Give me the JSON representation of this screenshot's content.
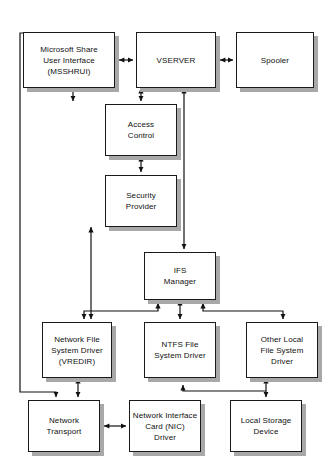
{
  "diagram": {
    "background_color": "#ffffff",
    "box_fill": "#ffffff",
    "box_border_color": "#1a1a1a",
    "shadow_color": "#a8a8a8",
    "connector_color": "#111111",
    "nodes": [
      {
        "id": "msshrui",
        "label": "Microsoft Share\nUser Interface\n(MSSHRUI)",
        "x": 23,
        "y": 32,
        "width": 92,
        "height": 56
      },
      {
        "id": "vserver",
        "label": "VSERVER",
        "x": 136,
        "y": 32,
        "width": 80,
        "height": 56
      },
      {
        "id": "spooler",
        "label": "Spooler",
        "x": 236,
        "y": 32,
        "width": 78,
        "height": 56
      },
      {
        "id": "access-control",
        "label": "Access\nControl",
        "x": 105,
        "y": 104,
        "width": 72,
        "height": 52
      },
      {
        "id": "security-provider",
        "label": "Security\nProvider",
        "x": 105,
        "y": 175,
        "width": 72,
        "height": 52
      },
      {
        "id": "ifs-manager",
        "label": "IFS\nManager",
        "x": 144,
        "y": 252,
        "width": 72,
        "height": 48
      },
      {
        "id": "vredir",
        "label": "Network File\nSystem Driver\n(VREDIR)",
        "x": 42,
        "y": 322,
        "width": 70,
        "height": 56
      },
      {
        "id": "ntfs",
        "label": "NTFS File\nSystem Driver",
        "x": 144,
        "y": 322,
        "width": 72,
        "height": 56
      },
      {
        "id": "other-local-fs",
        "label": "Other Local\nFile System\nDriver",
        "x": 246,
        "y": 322,
        "width": 72,
        "height": 56
      },
      {
        "id": "network-transport",
        "label": "Network\nTransport",
        "x": 28,
        "y": 400,
        "width": 72,
        "height": 52
      },
      {
        "id": "nic-driver",
        "label": "Network Interface\nCard (NIC)\nDriver",
        "x": 129,
        "y": 400,
        "width": 72,
        "height": 52
      },
      {
        "id": "local-storage",
        "label": "Local Storage\nDevice",
        "x": 230,
        "y": 400,
        "width": 72,
        "height": 52
      }
    ],
    "connectors": [
      {
        "id": "msshrui-vserver",
        "from": "msshrui",
        "to": "vserver",
        "arrow": "double",
        "orientation": "horizontal"
      },
      {
        "id": "vserver-spooler",
        "from": "vserver",
        "to": "spooler",
        "arrow": "double",
        "orientation": "horizontal"
      },
      {
        "id": "msshrui-access-control",
        "from": "msshrui",
        "to": "access-control",
        "arrow": "single",
        "orientation": "vertical"
      },
      {
        "id": "vserver-access-control",
        "from": "vserver",
        "to": "access-control",
        "arrow": "double",
        "orientation": "vertical"
      },
      {
        "id": "access-control-security-provider",
        "from": "access-control",
        "to": "security-provider",
        "arrow": "double",
        "orientation": "vertical"
      },
      {
        "id": "vserver-ifs-manager",
        "from": "vserver",
        "to": "ifs-manager",
        "arrow": "double",
        "orientation": "vertical"
      },
      {
        "id": "ifs-manager-vredir",
        "from": "ifs-manager",
        "to": "vredir",
        "arrow": "double",
        "orientation": "elbow"
      },
      {
        "id": "ifs-manager-ntfs",
        "from": "ifs-manager",
        "to": "ntfs",
        "arrow": "double",
        "orientation": "vertical"
      },
      {
        "id": "ifs-manager-other-local-fs",
        "from": "ifs-manager",
        "to": "other-local-fs",
        "arrow": "double",
        "orientation": "elbow"
      },
      {
        "id": "security-provider-vredir",
        "from": "security-provider",
        "to": "vredir",
        "arrow": "double",
        "orientation": "vertical"
      },
      {
        "id": "msshrui-network-transport",
        "from": "msshrui",
        "to": "network-transport",
        "arrow": "single",
        "orientation": "elbow-left"
      },
      {
        "id": "vredir-network-transport",
        "from": "vredir",
        "to": "network-transport",
        "arrow": "double",
        "orientation": "vertical"
      },
      {
        "id": "network-transport-nic-driver",
        "from": "network-transport",
        "to": "nic-driver",
        "arrow": "double",
        "orientation": "horizontal"
      },
      {
        "id": "ntfs-local-storage",
        "from": "ntfs",
        "to": "local-storage",
        "arrow": "single",
        "orientation": "elbow"
      },
      {
        "id": "other-local-fs-local-storage",
        "from": "other-local-fs",
        "to": "local-storage",
        "arrow": "double",
        "orientation": "vertical"
      }
    ]
  }
}
